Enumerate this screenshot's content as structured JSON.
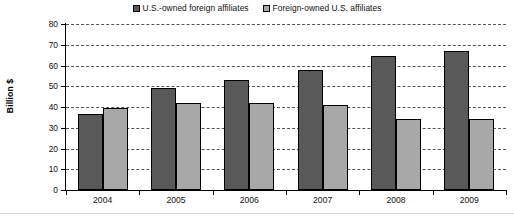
{
  "chart_data": {
    "type": "bar",
    "title": "",
    "xlabel": "",
    "ylabel": "Billion $",
    "categories": [
      "2004",
      "2005",
      "2006",
      "2007",
      "2008",
      "2009"
    ],
    "series": [
      {
        "name": "U.S.-owned foreign affiliates",
        "color": "#595959",
        "values": [
          36.5,
          49.2,
          52.8,
          57.8,
          64.5,
          67.0
        ]
      },
      {
        "name": "Foreign-owned U.S. affiliates",
        "color": "#a8a8a8",
        "values": [
          39.7,
          42.0,
          42.0,
          41.0,
          34.0,
          34.0
        ]
      }
    ],
    "ylim": [
      0,
      80
    ],
    "yticks": [
      "0",
      "10",
      "20",
      "30",
      "40",
      "50",
      "60",
      "70",
      "80"
    ],
    "grid": true,
    "legend_position": "top"
  },
  "legend": {
    "entries": [
      {
        "label": "U.S.-owned foreign affiliates"
      },
      {
        "label": "Foreign-owned U.S. affiliates"
      }
    ]
  },
  "axes": {
    "y_title": "Billion $"
  }
}
